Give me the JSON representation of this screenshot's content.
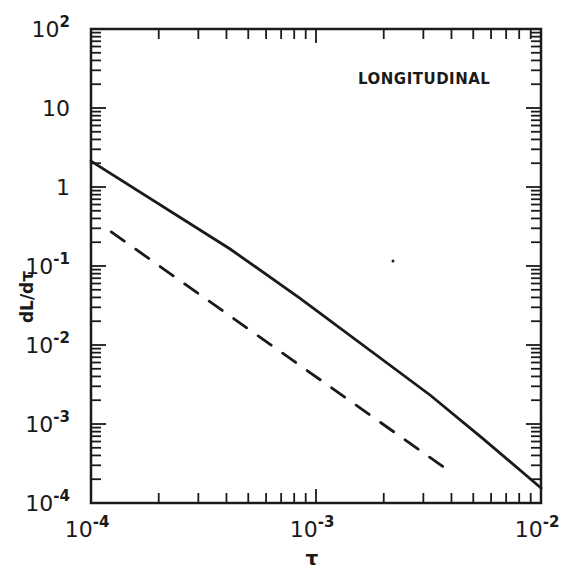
{
  "chart_data": {
    "type": "line",
    "title": "",
    "annotation": "LONGITUDINAL",
    "xlabel": "τ",
    "ylabel": "dL/dτ",
    "xscale": "log",
    "yscale": "log",
    "xlim": [
      0.0001,
      0.01
    ],
    "ylim": [
      0.0001,
      100
    ],
    "grid": false,
    "legend": null,
    "x_ticks": [
      {
        "value": 0.0001,
        "base": "10",
        "exp": "-4"
      },
      {
        "value": 0.001,
        "base": "10",
        "exp": "-3"
      },
      {
        "value": 0.01,
        "base": "10",
        "exp": "-2"
      }
    ],
    "y_ticks": [
      {
        "value": 0.0001,
        "base": "10",
        "exp": "-4"
      },
      {
        "value": 0.001,
        "base": "10",
        "exp": "-3"
      },
      {
        "value": 0.01,
        "base": "10",
        "exp": "-2"
      },
      {
        "value": 0.1,
        "base": "10",
        "exp": "-1"
      },
      {
        "value": 1,
        "base": "1",
        "exp": ""
      },
      {
        "value": 10,
        "base": "10",
        "exp": ""
      },
      {
        "value": 100,
        "base": "10",
        "exp": "2"
      }
    ],
    "series": [
      {
        "name": "solid",
        "style": "solid",
        "x": [
          0.0001,
          0.000415,
          0.00085,
          0.00321,
          0.0055,
          0.01
        ],
        "y": [
          2.13,
          0.164,
          0.039,
          0.00233,
          0.00066,
          0.000155
        ]
      },
      {
        "name": "dashed",
        "style": "dashed",
        "x": [
          0.000123,
          0.00374
        ],
        "y": [
          0.27,
          0.000277
        ]
      }
    ]
  },
  "colors": {
    "ink": "#1a1a1a",
    "background": "#ffffff"
  }
}
